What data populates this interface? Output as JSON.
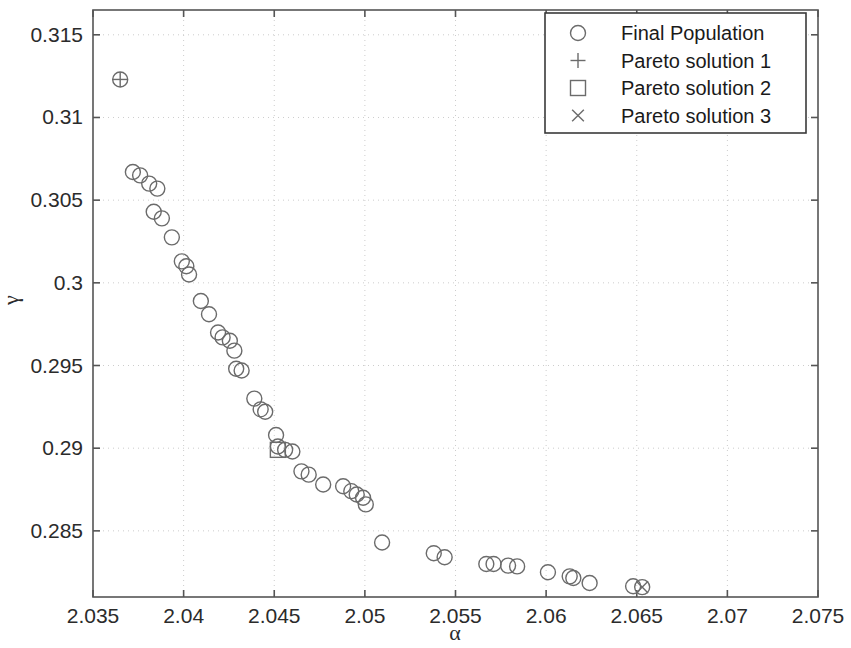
{
  "chart_data": {
    "type": "scatter",
    "title": "",
    "xlabel": "α",
    "ylabel": "γ",
    "xlim": [
      2.035,
      2.075
    ],
    "ylim": [
      0.281,
      0.3165
    ],
    "xticks": [
      2.035,
      2.04,
      2.045,
      2.05,
      2.055,
      2.06,
      2.065,
      2.07,
      2.075
    ],
    "xtick_labels": [
      "2.035",
      "2.04",
      "2.045",
      "2.05",
      "2.055",
      "2.06",
      "2.065",
      "2.07",
      "2.075"
    ],
    "yticks": [
      0.285,
      0.29,
      0.295,
      0.3,
      0.305,
      0.31,
      0.315
    ],
    "ytick_labels": [
      "0.285",
      "0.29",
      "0.295",
      "0.3",
      "0.305",
      "0.31",
      "0.315"
    ],
    "grid": true,
    "grid_style": "dotted",
    "grid_color": "#cccccc",
    "axis_color": "#555555",
    "marker_color": "#6b6b6b",
    "legend_position": "top-right",
    "series": [
      {
        "name": "Final Population",
        "marker": "circle",
        "points": [
          [
            2.0365,
            0.3123
          ],
          [
            2.0372,
            0.3067
          ],
          [
            2.0376,
            0.3065
          ],
          [
            2.0381,
            0.306
          ],
          [
            2.03855,
            0.3057
          ],
          [
            2.03835,
            0.3043
          ],
          [
            2.0388,
            0.3039
          ],
          [
            2.03935,
            0.30275
          ],
          [
            2.0399,
            0.3013
          ],
          [
            2.04015,
            0.301
          ],
          [
            2.0403,
            0.3005
          ],
          [
            2.04095,
            0.2989
          ],
          [
            2.0414,
            0.2981
          ],
          [
            2.0419,
            0.297
          ],
          [
            2.04215,
            0.2967
          ],
          [
            2.04255,
            0.2965
          ],
          [
            2.0428,
            0.2959
          ],
          [
            2.0429,
            0.2948
          ],
          [
            2.0432,
            0.2947
          ],
          [
            2.0439,
            0.293
          ],
          [
            2.04425,
            0.29235
          ],
          [
            2.0445,
            0.2922
          ],
          [
            2.0451,
            0.2908
          ],
          [
            2.0452,
            0.2901
          ],
          [
            2.0456,
            0.2899
          ],
          [
            2.046,
            0.2898
          ],
          [
            2.0465,
            0.2886
          ],
          [
            2.0469,
            0.2884
          ],
          [
            2.0477,
            0.2878
          ],
          [
            2.0488,
            0.2877
          ],
          [
            2.04925,
            0.2874
          ],
          [
            2.04955,
            0.2872
          ],
          [
            2.0499,
            0.287
          ],
          [
            2.05005,
            0.2866
          ],
          [
            2.05095,
            0.2843
          ],
          [
            2.0538,
            0.28365
          ],
          [
            2.0544,
            0.2834
          ],
          [
            2.0567,
            0.283
          ],
          [
            2.0571,
            0.283
          ],
          [
            2.0579,
            0.2829
          ],
          [
            2.0584,
            0.28285
          ],
          [
            2.0601,
            0.2825
          ],
          [
            2.0613,
            0.28225
          ],
          [
            2.0615,
            0.28215
          ],
          [
            2.0624,
            0.28185
          ],
          [
            2.0648,
            0.28165
          ],
          [
            2.0653,
            0.2816
          ]
        ]
      },
      {
        "name": "Pareto solution 1",
        "marker": "plus",
        "points": [
          [
            2.0365,
            0.3123
          ]
        ]
      },
      {
        "name": "Pareto solution 2",
        "marker": "square",
        "points": [
          [
            2.0452,
            0.2899
          ]
        ]
      },
      {
        "name": "Pareto solution 3",
        "marker": "cross",
        "points": [
          [
            2.0653,
            0.2816
          ]
        ]
      }
    ],
    "legend": [
      {
        "label": "Final Population",
        "marker": "circle"
      },
      {
        "label": "Pareto solution 1",
        "marker": "plus"
      },
      {
        "label": "Pareto solution 2",
        "marker": "square"
      },
      {
        "label": "Pareto solution 3",
        "marker": "cross"
      }
    ]
  }
}
